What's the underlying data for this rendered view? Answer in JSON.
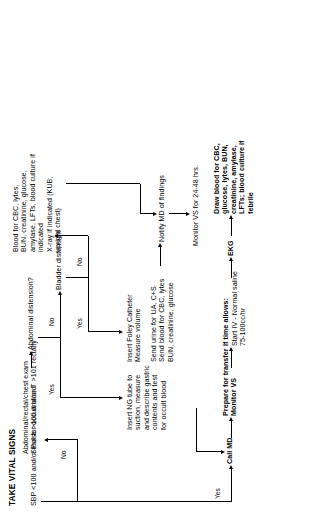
{
  "diagram": {
    "title": "TAKE VITAL SIGNS",
    "root": "SBP <100 and/or Pulse >100 and/or T >101 rectally",
    "branch_labels": {
      "root_yes": "Yes",
      "root_no": "No",
      "distension_yes": "Yes",
      "distension_no": "No",
      "bladder_yes": "Yes",
      "bladder_no": "No"
    },
    "nodes": {
      "call_md": "Call MD",
      "prepare_transfer": "Prepare for transfer\nMonitor VS",
      "if_time_allows_head": "If time allows:",
      "if_time_allows_body": "Start IV - Normal saline\n75-100cc/hr",
      "ekg": "EKG",
      "draw_blood": "Draw blood for CBC,\nglucose, lytes, BUN,\ncreatinine, amylase,\nLFTs; blood culture if\nfebrile",
      "abdominal_exam": "Abdominal/rectal/chest exam\nStool for occult blood",
      "abdominal_distension": "Abdominal distension?",
      "ng_tube": "Insert NG tube to\nsuction, measure\nand describe gastric\ncontents and test\nfor occult blood",
      "bladder_distension": "Bladder distension",
      "foley": "Insert Foley Catheter\nMeasure volume",
      "send_urine": "Send urine for UA, C+S\nSend blood for CBC, lytes\nBUN, creatinine, glucose",
      "blood_for_cbc": "Blood for CBC, lytes,\nBUN, creatinine, glucose,\namylase, LFTs, blood culture if\nindicated\nX-ray if indicated (KUB,\nupright chest)",
      "notify_md": "Notify MD of findings",
      "monitor_vs": "Monitor VS for 24-48 hrs."
    }
  }
}
